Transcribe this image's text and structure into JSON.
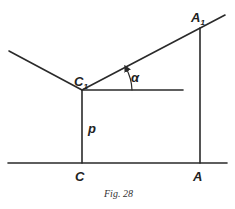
{
  "figure": {
    "caption": "Fig. 28",
    "labels": {
      "C1": {
        "main": "C",
        "sub": "1"
      },
      "A1": {
        "main": "A",
        "sub": "1"
      },
      "C": "C",
      "A": "A",
      "p": "p",
      "alpha": "α"
    }
  }
}
